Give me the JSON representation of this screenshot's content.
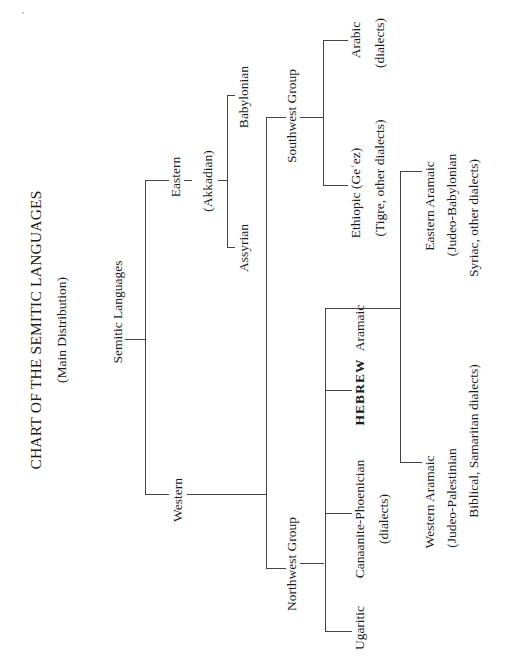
{
  "title": "CHART OF THE SEMITIC LANGUAGES",
  "subtitle": "(Main Distribution)",
  "root": "Semitic Languages",
  "branches": {
    "eastern": {
      "label": "Eastern",
      "sublabel": "(Akkadian)",
      "children": [
        "Babylonian",
        "Assyrian"
      ]
    },
    "western": {
      "label": "Western",
      "groups": {
        "southwest": {
          "label": "Southwest Group",
          "children": [
            {
              "label": "Arabic",
              "note": "(dialects)"
            },
            {
              "label": "Ethiopic (Geʿez)",
              "note": "(Tigre, other dialects)"
            }
          ]
        },
        "northwest": {
          "label": "Northwest Group",
          "children": [
            {
              "label": "Ugaritic"
            },
            {
              "label": "Canaanite-Phoenician",
              "note": "(dialects)"
            },
            {
              "label": "HEBREW"
            },
            {
              "label": "Aramaic"
            }
          ],
          "aramaic": {
            "eastern": {
              "label": "Eastern Aramaic",
              "line2": "(Judeo-Babylonian",
              "line3": "Syriac, other dialects)"
            },
            "western": {
              "label": "Western Aramaic",
              "line2": "(Judeo-Palestinian",
              "line3": "Biblical, Samaritan dialects)"
            }
          }
        }
      }
    }
  }
}
